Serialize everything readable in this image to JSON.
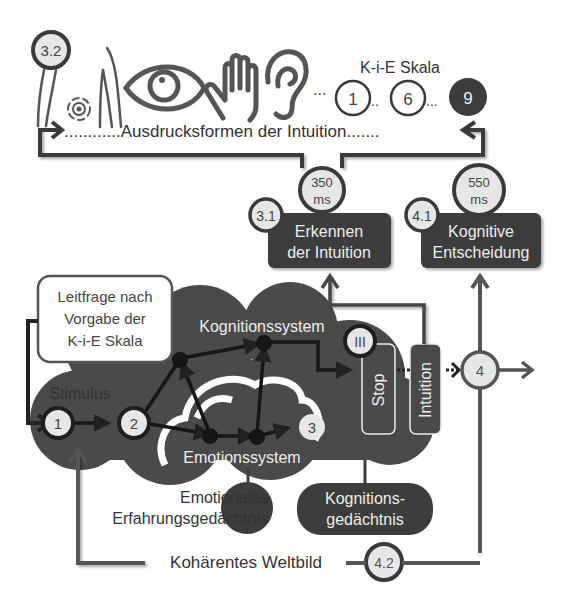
{
  "colors": {
    "dark": "#3d3d3d",
    "cloud": "#4a4a4a",
    "line": "#555555",
    "circle_fill": "#e6e6e6",
    "white": "#ffffff",
    "text": "#333333"
  },
  "top": {
    "step_badge": "3.2",
    "icons": [
      "body-sense-icon",
      "target-icon",
      "posture-icon",
      "eye-icon",
      "hand-icon",
      "ear-icon"
    ],
    "ellipsis": "...",
    "scale_title": "K-i-E Skala",
    "scale_values": [
      "1",
      "6",
      "9"
    ],
    "scale_sep": "..",
    "expressions_label": "............Ausdrucksformen der Intuition......."
  },
  "middle": {
    "recognition": {
      "badge": "3.1",
      "time_value": "350",
      "time_unit": "ms",
      "title_line1": "Erkennen",
      "title_line2": "der Intuition"
    },
    "decision": {
      "badge": "4.1",
      "time_value": "550",
      "time_unit": "ms",
      "title_line1": "Kognitive",
      "title_line2": "Entscheidung"
    }
  },
  "main": {
    "guiding_question": [
      "Leitfrage nach",
      "Vorgabe der",
      "K-i-E Skala"
    ],
    "stimulus_label": "Stimulus",
    "nodes": [
      "1",
      "2",
      "3",
      "4"
    ],
    "roman_badge": "III",
    "cognition_system": "Kognitionssystem",
    "emotion_system": "Emotionssystem",
    "stop_label": "Stop",
    "intuition_label": "Intuition"
  },
  "bottom": {
    "emotional_memory": [
      "Emotionales",
      "Erfahrungsgedächtnis"
    ],
    "cognition_memory": [
      "Kognitions-",
      "gedächtnis"
    ],
    "world_view": "Kohärentes Weltbild",
    "world_badge": "4.2"
  }
}
